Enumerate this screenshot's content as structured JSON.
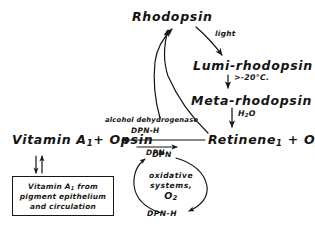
{
  "diagram": {
    "background_color": "#ffffff",
    "ink_color": "#141414",
    "nodes": {
      "rhodopsin": "Rhodopsin",
      "lumi_rhodopsin": "Lumi-rhodopsin",
      "meta_rhodopsin": "Meta-rhodopsin",
      "retinene_opsin_pre": "Retinene",
      "retinene_sub": "1",
      "retinene_opsin_post": " + Opsin",
      "vitamin_a_pre": "Vitamin A",
      "vitamin_a_sub": "1",
      "vitamin_a_post": "+ Opsin"
    },
    "arrow_labels": {
      "light": "light",
      "temperature": ">-20°C.",
      "water_pre": "H",
      "water_sub": "2",
      "water_post": "O",
      "enzyme": "alcohol dehydrogenase",
      "reductant": "DPN-H",
      "oxidant_forward": "DPN"
    },
    "oxidative_cycle": {
      "top_label": "DPN",
      "bottom_label": "DPN-H",
      "inner_line_1": "oxidative",
      "inner_line_2": "systems,",
      "inner_line_3": "O",
      "inner_line_3_sub": "2"
    },
    "source_box": {
      "line_1_pre": "Vitamin A",
      "line_1_sub": "1",
      "line_1_post": " from",
      "line_2": "pigment epithelium",
      "line_3": "and circulation"
    }
  }
}
